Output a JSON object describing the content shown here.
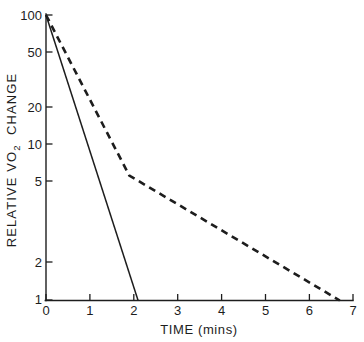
{
  "chart_data": {
    "type": "line",
    "title": "",
    "xlabel": "TIME  (mins)",
    "ylabel": "RELATIVE  VO2  CHANGE",
    "ylabel_prefix": "RELATIVE  VO",
    "ylabel_subscript": "2",
    "ylabel_suffix": "CHANGE",
    "yscale": "log",
    "xscale": "linear",
    "xlim": [
      0,
      7
    ],
    "ylim": [
      1,
      100
    ],
    "grid": false,
    "legend": "none",
    "xticks": [
      0,
      1,
      2,
      3,
      4,
      5,
      6,
      7
    ],
    "xtick_labels": [
      "0",
      "1",
      "2",
      "3",
      "4",
      "5",
      "6",
      "7"
    ],
    "yticks": [
      1,
      2,
      5,
      10,
      20,
      50,
      100
    ],
    "ytick_labels": [
      "1",
      "2",
      "5",
      "10",
      "20",
      "50",
      "100"
    ],
    "series": [
      {
        "name": "solid-curve",
        "style": "solid",
        "color": "#1d1d1d",
        "x": [
          0,
          2.1
        ],
        "values": [
          100,
          1
        ]
      },
      {
        "name": "dashed-curve",
        "style": "dashed",
        "color": "#1d1d1d",
        "x": [
          0,
          1.9,
          6.7
        ],
        "values": [
          100,
          7.5,
          1
        ]
      }
    ]
  },
  "figure": {
    "background_color": "#ffffff",
    "ink_color": "#1d1d1d"
  }
}
